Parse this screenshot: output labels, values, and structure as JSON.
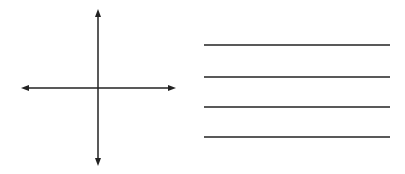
{
  "diagram": {
    "type": "coordinate-axes-worksheet",
    "axes": {
      "horizontal_arrows": [
        "left",
        "right"
      ],
      "vertical_arrows": [
        "up",
        "down"
      ]
    },
    "answer_lines": {
      "count": 4
    },
    "colors": {
      "background": "#ffffff",
      "stroke": "#222222"
    }
  }
}
